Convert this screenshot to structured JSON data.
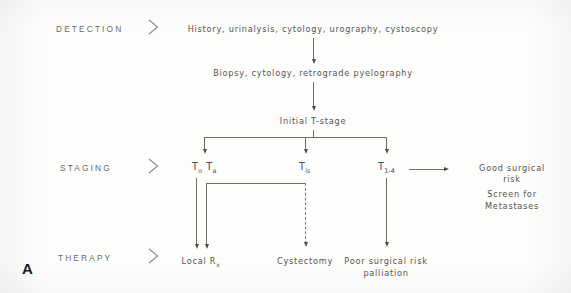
{
  "figure": {
    "panel_label": "A",
    "chevron_glyph": ">"
  },
  "rows": [
    {
      "label": "DETECTION"
    },
    {
      "label": "STAGING"
    },
    {
      "label": "THERAPY"
    }
  ],
  "nodes": {
    "detection_workup": "History, urinalysis, cytology, urography, cystoscopy",
    "diagnostic_workup": "Biopsy, cytology, retrograde pyelography",
    "initial_stage": "Initial T-stage"
  },
  "stages": {
    "t0ta_main": "T",
    "t0_sub": "o",
    "ta_main": "T",
    "ta_sub": "a",
    "tis_main": "T",
    "tis_sub": "is",
    "t14_main": "T",
    "t14_sub": "1-4"
  },
  "outcomes": {
    "good_risk_line1": "Good surgical",
    "good_risk_line2": "risk",
    "screen_line1": "Screen for",
    "screen_line2": "Metastases"
  },
  "therapy": {
    "local_main": "Local R",
    "local_sub": "x",
    "cystectomy": "Cystectomy",
    "poor_risk_line1": "Poor surgical risk",
    "poor_risk_line2": "palliation"
  },
  "colors": {
    "ink": "#555350",
    "line": "#6f6d6a",
    "arrow": "#4f4d4a",
    "panel": "#18181a",
    "paper": "#fdfdfc"
  }
}
